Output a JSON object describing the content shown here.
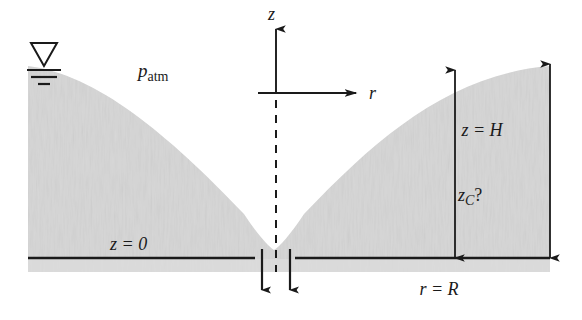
{
  "figure": {
    "type": "engineering-diagram",
    "width": 582,
    "height": 320
  },
  "colors": {
    "fluid_fill": "#d5d5d5",
    "fluid_fill_light": "#dedede",
    "line": "#1a1a1a",
    "background": "#ffffff"
  },
  "labels": {
    "p_atm": {
      "symbol": "p",
      "subscript": "atm"
    },
    "z_axis": "z",
    "r_axis": "r",
    "z_zero": "z = 0",
    "z_H": "z = H",
    "z_C": {
      "symbol": "z",
      "subscript": "C",
      "suffix": "?"
    },
    "r_R": "r = R"
  },
  "geometry": {
    "origin": {
      "x": 276,
      "y": 93
    },
    "baseline_y": 258,
    "left_wall_x": 28,
    "right_wall_x": 550,
    "surface_top_y": 66,
    "cusp_y": 250,
    "baseline_left": {
      "x1": 28,
      "x2": 255
    },
    "baseline_right": {
      "x1": 295,
      "x2": 550
    },
    "dim_inner_x": 455,
    "dim_outer_x": 550
  },
  "annotations": {
    "free_surface_symbol": "inverted-triangle-with-three-lines",
    "centerline_style": "dashed",
    "center_gap_arrows": 2,
    "dimension_arrows": 2
  }
}
